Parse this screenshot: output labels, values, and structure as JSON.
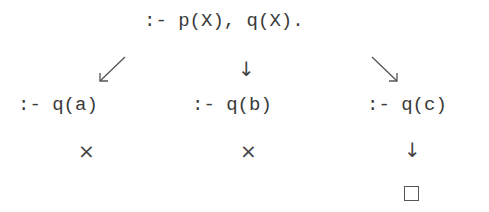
{
  "root": {
    "goal": ":- p(X), q(X)."
  },
  "branches": [
    {
      "goal": ":- q(a)",
      "result": "×",
      "result_type": "failure"
    },
    {
      "goal": ":- q(b)",
      "result": "×",
      "result_type": "failure"
    },
    {
      "goal": ":- q(c)",
      "result": "□",
      "result_type": "success"
    }
  ],
  "symbols": {
    "down_arrow": "↓",
    "fail": "×",
    "success": "□"
  }
}
